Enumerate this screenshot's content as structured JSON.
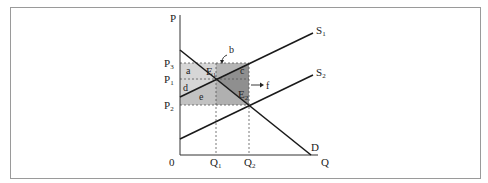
{
  "diagram": {
    "type": "supply-demand",
    "axes": {
      "y_label": "P",
      "x_label": "Q",
      "origin_label": "0"
    },
    "price_levels": [
      {
        "id": "P3",
        "label": "P",
        "sub": "3"
      },
      {
        "id": "P1",
        "label": "P",
        "sub": "1"
      },
      {
        "id": "P2",
        "label": "P",
        "sub": "2"
      }
    ],
    "quantity_levels": [
      {
        "id": "Q1",
        "label": "Q",
        "sub": "1"
      },
      {
        "id": "Q2",
        "label": "Q",
        "sub": "2"
      }
    ],
    "curves": [
      {
        "id": "S1",
        "label": "S",
        "sub": "1"
      },
      {
        "id": "S2",
        "label": "S",
        "sub": "2"
      },
      {
        "id": "D",
        "label": "D"
      }
    ],
    "equilibria": [
      {
        "id": "E1",
        "label": "E",
        "sub": "1"
      },
      {
        "id": "E2",
        "label": "E",
        "sub": "2"
      }
    ],
    "areas": {
      "a": "a",
      "b": "b",
      "c": "c",
      "d": "d",
      "e": "e",
      "f": "f"
    },
    "colors": {
      "line": "#1a1a1a",
      "dashed": "#555555",
      "shade_light": "#d6d6d6",
      "shade_medium_light": "#c2c2c2",
      "shade_medium": "#b4b4b4",
      "shade_dark": "#8f8f8f"
    }
  }
}
